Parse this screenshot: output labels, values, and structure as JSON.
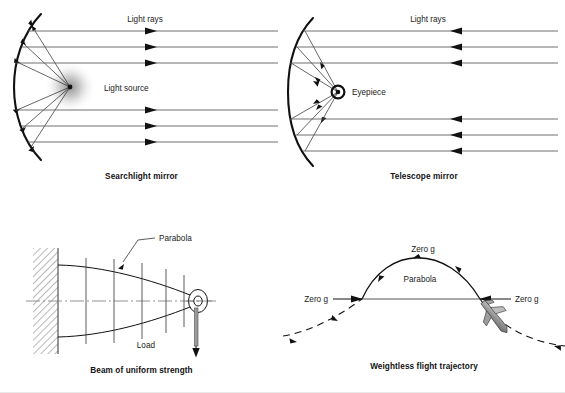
{
  "figure": {
    "background": "#ffffff",
    "ink": "#1a1a1a",
    "ray_color": "#555555",
    "glow_color": "#b9b9b9",
    "plane_fill": "#9a9a9a"
  },
  "panels": [
    {
      "id": "searchlight-mirror",
      "caption": "Searchlight mirror",
      "labels": [
        {
          "name": "light-rays-label",
          "text": "Light rays",
          "x": 145,
          "y": 22
        },
        {
          "name": "light-source-label",
          "text": "Light source",
          "x": 104,
          "y": 97
        }
      ],
      "rays": {
        "count": 6,
        "y": [
          31,
          47,
          63,
          110,
          126,
          142
        ],
        "x_start": 26,
        "x_end": 278,
        "arrow_x": 155,
        "direction": "right"
      },
      "source": {
        "x": 70,
        "y": 87,
        "glow_radius": 24
      },
      "mirror": {
        "apex_x": 14,
        "apex_y": 87,
        "top_y": 14,
        "bottom_y": 160
      }
    },
    {
      "id": "telescope-mirror",
      "caption": "Telescope mirror",
      "labels": [
        {
          "name": "light-rays-label",
          "text": "Light rays",
          "x": 428,
          "y": 22
        },
        {
          "name": "eyepiece-label",
          "text": "Eyepiece",
          "x": 352,
          "y": 95
        }
      ],
      "rays": {
        "count": 6,
        "y": [
          31,
          47,
          63,
          110,
          126,
          142
        ],
        "x_start": 295,
        "x_end": 556,
        "arrow_x": 450,
        "direction": "left"
      },
      "eyepiece": {
        "x": 338,
        "y": 92,
        "outer_r": 6.5,
        "inner_r": 2.2
      },
      "mirror": {
        "apex_x": 288,
        "apex_y": 92,
        "top_y": 18,
        "bottom_y": 166
      }
    },
    {
      "id": "beam-of-uniform-strength",
      "caption": "Beam of uniform strength",
      "labels": [
        {
          "name": "parabola-label",
          "text": "Parabola",
          "x": 160,
          "y": 245
        },
        {
          "name": "load-label",
          "text": "Load",
          "x": 173,
          "y": 345
        }
      ],
      "wall": {
        "x": 33,
        "y": 248,
        "w": 25,
        "h": 106,
        "hatch": "diagonal"
      },
      "beam": {
        "root_x": 58,
        "root_top_y": 265,
        "root_bottom_y": 337,
        "tip_x": 196,
        "axis_y": 301
      },
      "ticks_x": [
        86,
        114,
        142,
        166,
        184
      ],
      "eye": {
        "x": 198,
        "y": 301,
        "outer_rx": 9,
        "outer_ry": 11,
        "hole_r": 4
      },
      "load_arrow": {
        "x": 196,
        "y_from": 308,
        "y_to": 352
      }
    },
    {
      "id": "weightless-flight-trajectory",
      "caption": "Weightless flight trajectory",
      "labels": [
        {
          "name": "zero-g-top-label",
          "text": "Zero g",
          "x": 424,
          "y": 252
        },
        {
          "name": "parabola-label",
          "text": "Parabola",
          "x": 418,
          "y": 282
        },
        {
          "name": "zero-g-left-label",
          "text": "Zero g",
          "x": 320,
          "y": 298
        },
        {
          "name": "zero-g-right-label",
          "text": "Zero g",
          "x": 520,
          "y": 298
        }
      ],
      "arc": {
        "left_x": 362,
        "right_x": 480,
        "apex_x": 421,
        "apex_y": 258,
        "base_y": 299
      },
      "chord_y": 299,
      "aircraft": {
        "x": 489,
        "y": 315,
        "angle_deg": 52
      }
    }
  ]
}
